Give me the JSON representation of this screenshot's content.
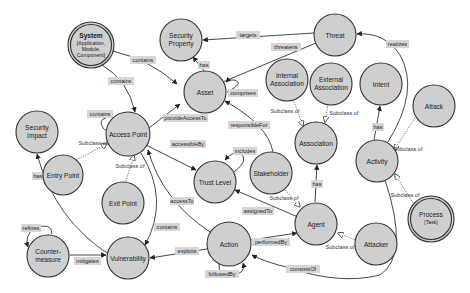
{
  "diagram": {
    "type": "ontology-concept-map",
    "colors": {
      "node_fill": "#cfcfcf",
      "node_stroke": "#333333",
      "edge_stroke": "#333333",
      "subclass_edge_stroke": "#777777",
      "label_bg": "#d6d6d6",
      "background": "#ffffff"
    },
    "nodes": {
      "system": {
        "line1": "System",
        "line2": "[Application,",
        "line3": "Module,",
        "line4": "Component]"
      },
      "security_property": {
        "line1": "Security",
        "line2": "Property"
      },
      "threat": {
        "label": "Threat"
      },
      "asset": {
        "label": "Asset"
      },
      "internal_association": {
        "line1": "Internal",
        "line2": "Association"
      },
      "external_association": {
        "line1": "External",
        "line2": "Association"
      },
      "intent": {
        "label": "Intent"
      },
      "security_impact": {
        "line1": "Security",
        "line2": "Impact"
      },
      "access_point": {
        "label": "Access Point"
      },
      "association": {
        "label": "Association"
      },
      "attack": {
        "label": "Attack"
      },
      "activity": {
        "label": "Activity"
      },
      "entry_point": {
        "label": "Entry Point"
      },
      "exit_point": {
        "label": "Exit Point"
      },
      "trust_level": {
        "label": "Trust Level"
      },
      "stakeholder": {
        "label": "Stakeholder"
      },
      "agent": {
        "label": "Agent"
      },
      "process": {
        "line1": "Process",
        "line2": "[Task]"
      },
      "attacker": {
        "label": "Attacker"
      },
      "countermeasure": {
        "line1": "Counter-",
        "line2": "measure"
      },
      "vulnerability": {
        "label": "Vulnerability"
      },
      "action": {
        "label": "Action"
      }
    },
    "edges": {
      "system_contains_asset": "contains",
      "system_contains_access_point": "contains",
      "threat_targets_security_property": "targets",
      "threat_threatens_asset": "threatens",
      "asset_has_security_property": "has",
      "asset_comprises_asset": "comprises",
      "activity_realizes_threat": "realizes",
      "access_point_contains_access_point": "contains",
      "access_point_provides_access_to_asset": "provideAccessTo",
      "stakeholder_responsible_for_asset": "responsibleFor",
      "access_point_accessible_by_trust_level": "accessibleBy",
      "trust_level_includes_trust_level": "includes",
      "activity_has_intent": "has",
      "agent_has_association": "has",
      "security_impact_has_vulnerability": "has",
      "agent_assigned_to_trust_level": "assignedTo",
      "action_access_to_access_point": "accessTo",
      "access_point_contains_vulnerability": "contains",
      "countermeasure_refines_countermeasure": "refines",
      "countermeasure_mitigates_vulnerability": "mitigates",
      "action_exploits_vulnerability": "exploits",
      "action_performed_by_agent": "performedBy",
      "action_followed_by_action": "followedBy",
      "activity_consists_of_action": "consistsOf"
    },
    "subclass_label": "Subclass of"
  }
}
